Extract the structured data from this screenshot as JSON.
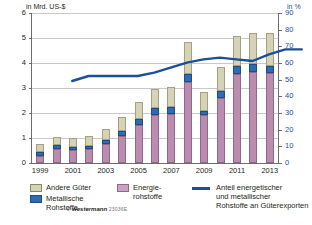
{
  "axes": {
    "left_title": "in Mrd. US-$",
    "right_title": "in %",
    "left_ticks": [
      "0",
      "1",
      "2",
      "3",
      "4",
      "5",
      "6"
    ],
    "right_ticks": [
      "0",
      "10",
      "20",
      "30",
      "40",
      "50",
      "60",
      "70",
      "80",
      "90"
    ],
    "x_ticks": [
      "1999",
      "2001",
      "2003",
      "2005",
      "2007",
      "2009",
      "2011",
      "2013"
    ]
  },
  "legend": {
    "andere_label": "Andere Güter",
    "metall_label_1": "Metallische",
    "metall_label_2": "Rohstoffe",
    "energie_label_1": "Energie-",
    "energie_label_2": "rohstoffe",
    "line_label_1": "Anteil energetischer",
    "line_label_2": "und metallischer",
    "line_label_3": "Rohstoffe an Güterexporten"
  },
  "copyright": {
    "symbol": "©",
    "publisher": "westermann",
    "code": "23036E"
  },
  "colors": {
    "energie": "#b98cb0",
    "metall": "#2d6cb5",
    "andere": "#d6d2b4",
    "line": "#1b4f9c",
    "grid": "#c9c9c9"
  },
  "chart_data": {
    "type": "bar",
    "title": "",
    "xlabel": "",
    "ylabel": "in Mrd. US-$",
    "y2label": "in %",
    "ylim": [
      0,
      6
    ],
    "y2lim": [
      0,
      90
    ],
    "grid": true,
    "legend_position": "bottom",
    "categories": [
      "1999",
      "2000",
      "2001",
      "2002",
      "2003",
      "2004",
      "2005",
      "2006",
      "2007",
      "2008",
      "2009",
      "2010",
      "2011",
      "2012",
      "2013"
    ],
    "series": [
      {
        "name": "Energierohstoffe",
        "stack": "goods",
        "values": [
          0.3,
          0.57,
          0.53,
          0.55,
          0.78,
          1.08,
          1.52,
          1.93,
          1.95,
          3.25,
          1.93,
          2.6,
          3.55,
          3.65,
          3.6
        ]
      },
      {
        "name": "Metallische Rohstoffe",
        "stack": "goods",
        "values": [
          0.13,
          0.15,
          0.12,
          0.12,
          0.16,
          0.22,
          0.25,
          0.27,
          0.28,
          0.32,
          0.17,
          0.28,
          0.32,
          0.3,
          0.3
        ]
      },
      {
        "name": "Andere Güter",
        "stack": "goods",
        "values": [
          0.32,
          0.34,
          0.37,
          0.4,
          0.42,
          0.54,
          0.66,
          0.76,
          0.82,
          1.28,
          0.74,
          0.98,
          1.2,
          1.25,
          1.3
        ]
      }
    ],
    "line_series": {
      "name": "Anteil energetischer und metallischer Rohstoffe an Güterexporten",
      "unit": "%",
      "axis": "right",
      "values": [
        57,
        60,
        60,
        60,
        60,
        62,
        65,
        68,
        70,
        71,
        70,
        69,
        73,
        76,
        76
      ]
    }
  }
}
